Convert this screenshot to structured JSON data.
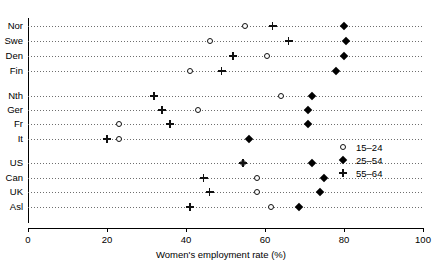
{
  "chart_data": {
    "type": "scatter",
    "title": "",
    "xlabel": "Women's employment rate (%)",
    "ylabel": "",
    "xlim": [
      0,
      100
    ],
    "xticks": [
      0,
      20,
      40,
      60,
      80,
      100
    ],
    "xticklabels": [
      "0",
      "20",
      "40",
      "60",
      "80",
      "100"
    ],
    "grid": "horizontal dotted rows",
    "legend_position": "right-middle",
    "categories": [
      "Nor",
      "Swe",
      "Den",
      "Fin",
      "Nth",
      "Ger",
      "Fr",
      "It",
      "US",
      "Can",
      "UK",
      "Asl"
    ],
    "group_breaks_after": [
      "Fin",
      "It"
    ],
    "series": [
      {
        "name": "15–24",
        "marker": "open-circle",
        "values": [
          55,
          46,
          60.5,
          41,
          64,
          43,
          23,
          23,
          54.5,
          58,
          58,
          61.5
        ]
      },
      {
        "name": "25–54",
        "marker": "filled-diamond",
        "values": [
          80,
          80.5,
          80,
          78,
          72,
          71,
          71,
          56,
          72,
          75,
          74,
          68.5
        ]
      },
      {
        "name": "55–64",
        "marker": "plus",
        "values": [
          62,
          66,
          52,
          49,
          32,
          34,
          36,
          20,
          54.5,
          44.5,
          46,
          41
        ]
      }
    ]
  },
  "legend": {
    "items": [
      {
        "label": "15–24",
        "marker": "open-circle"
      },
      {
        "label": "25–54",
        "marker": "filled-diamond"
      },
      {
        "label": "55–64",
        "marker": "plus"
      }
    ]
  },
  "axis": {
    "x_title": "Women's employment rate (%)",
    "x_tick_labels": [
      "0",
      "20",
      "40",
      "60",
      "80",
      "100"
    ],
    "y_labels": [
      "Nor",
      "Swe",
      "Den",
      "Fin",
      "Nth",
      "Ger",
      "Fr",
      "It",
      "US",
      "Can",
      "UK",
      "Asl"
    ]
  },
  "colors": {
    "marker": "#000000",
    "gridline": "#6e6e6e",
    "axis": "#000000",
    "background": "#ffffff"
  }
}
